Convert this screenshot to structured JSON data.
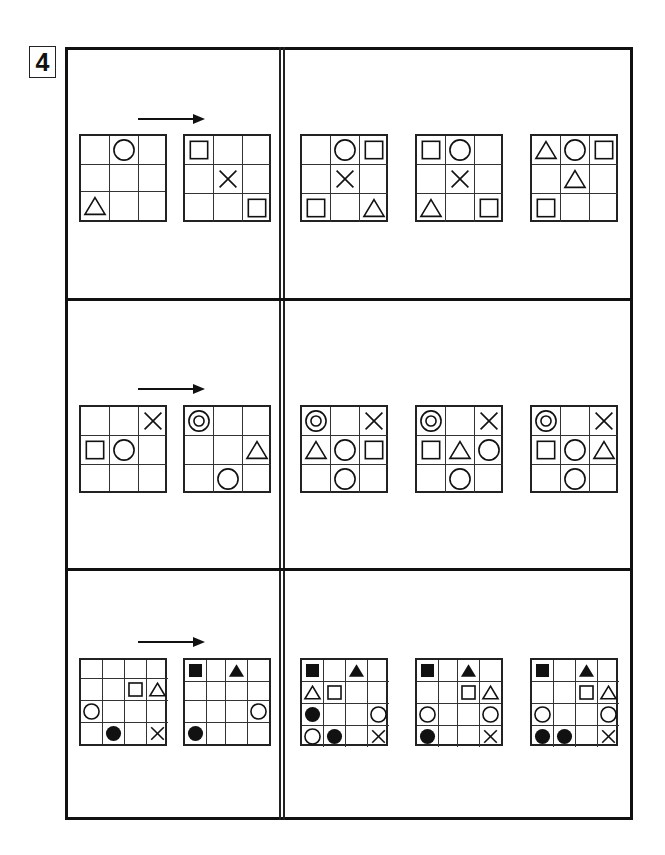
{
  "question_number": "4",
  "colors": {
    "ink": "#111111",
    "background": "#ffffff"
  },
  "rows": [
    {
      "size": 3,
      "left_panel": {
        "arrow": "right-arrow",
        "grids": [
          {
            "name": "source-grid",
            "cells": [
              [
                "",
                "circle",
                ""
              ],
              [
                "",
                "",
                ""
              ],
              [
                "triangle",
                "",
                ""
              ]
            ]
          },
          {
            "name": "transform-grid",
            "cells": [
              [
                "square",
                "",
                ""
              ],
              [
                "",
                "cross",
                ""
              ],
              [
                "",
                "",
                "square"
              ]
            ]
          }
        ]
      },
      "options": [
        {
          "cells": [
            [
              "",
              "circle",
              "square"
            ],
            [
              "",
              "cross",
              ""
            ],
            [
              "square",
              "",
              "triangle"
            ]
          ]
        },
        {
          "cells": [
            [
              "square",
              "circle",
              ""
            ],
            [
              "",
              "cross",
              ""
            ],
            [
              "triangle",
              "",
              "square"
            ]
          ]
        },
        {
          "cells": [
            [
              "triangle",
              "circle",
              "square"
            ],
            [
              "",
              "triangle",
              ""
            ],
            [
              "square",
              "",
              ""
            ]
          ]
        }
      ]
    },
    {
      "size": 3,
      "left_panel": {
        "arrow": "right-arrow",
        "grids": [
          {
            "name": "source-grid",
            "cells": [
              [
                "",
                "",
                "cross"
              ],
              [
                "square",
                "circle",
                ""
              ],
              [
                "",
                "",
                ""
              ]
            ]
          },
          {
            "name": "transform-grid",
            "cells": [
              [
                "double-circle",
                "",
                ""
              ],
              [
                "",
                "",
                "triangle"
              ],
              [
                "",
                "circle",
                ""
              ]
            ]
          }
        ]
      },
      "options": [
        {
          "cells": [
            [
              "double-circle",
              "",
              "cross"
            ],
            [
              "triangle",
              "circle",
              "square"
            ],
            [
              "",
              "circle",
              ""
            ]
          ]
        },
        {
          "cells": [
            [
              "double-circle",
              "",
              "cross"
            ],
            [
              "square",
              "triangle",
              "circle"
            ],
            [
              "",
              "circle",
              ""
            ]
          ]
        },
        {
          "cells": [
            [
              "double-circle",
              "",
              "cross"
            ],
            [
              "square",
              "circle",
              "triangle"
            ],
            [
              "",
              "circle",
              ""
            ]
          ]
        }
      ]
    },
    {
      "size": 4,
      "left_panel": {
        "arrow": "right-arrow",
        "grids": [
          {
            "name": "source-grid",
            "cells": [
              [
                "",
                "",
                "",
                ""
              ],
              [
                "",
                "",
                "square",
                "triangle"
              ],
              [
                "circle",
                "",
                "",
                ""
              ],
              [
                "",
                "filled-circle",
                "",
                "cross"
              ]
            ]
          },
          {
            "name": "transform-grid",
            "cells": [
              [
                "filled-square",
                "",
                "filled-triangle",
                ""
              ],
              [
                "",
                "",
                "",
                ""
              ],
              [
                "",
                "",
                "",
                "circle"
              ],
              [
                "filled-circle",
                "",
                "",
                ""
              ]
            ]
          }
        ]
      },
      "options": [
        {
          "cells": [
            [
              "filled-square",
              "",
              "filled-triangle",
              ""
            ],
            [
              "triangle",
              "square",
              "",
              ""
            ],
            [
              "filled-circle",
              "",
              "",
              "circle"
            ],
            [
              "circle",
              "filled-circle",
              "",
              "cross"
            ]
          ]
        },
        {
          "cells": [
            [
              "filled-square",
              "",
              "filled-triangle",
              ""
            ],
            [
              "",
              "",
              "square",
              "triangle"
            ],
            [
              "circle",
              "",
              "",
              "circle"
            ],
            [
              "filled-circle",
              "",
              "",
              "cross"
            ]
          ]
        },
        {
          "cells": [
            [
              "filled-square",
              "",
              "filled-triangle",
              ""
            ],
            [
              "",
              "",
              "square",
              "triangle"
            ],
            [
              "circle",
              "",
              "",
              "circle"
            ],
            [
              "filled-circle",
              "filled-circle",
              "",
              "cross"
            ]
          ]
        }
      ]
    }
  ]
}
